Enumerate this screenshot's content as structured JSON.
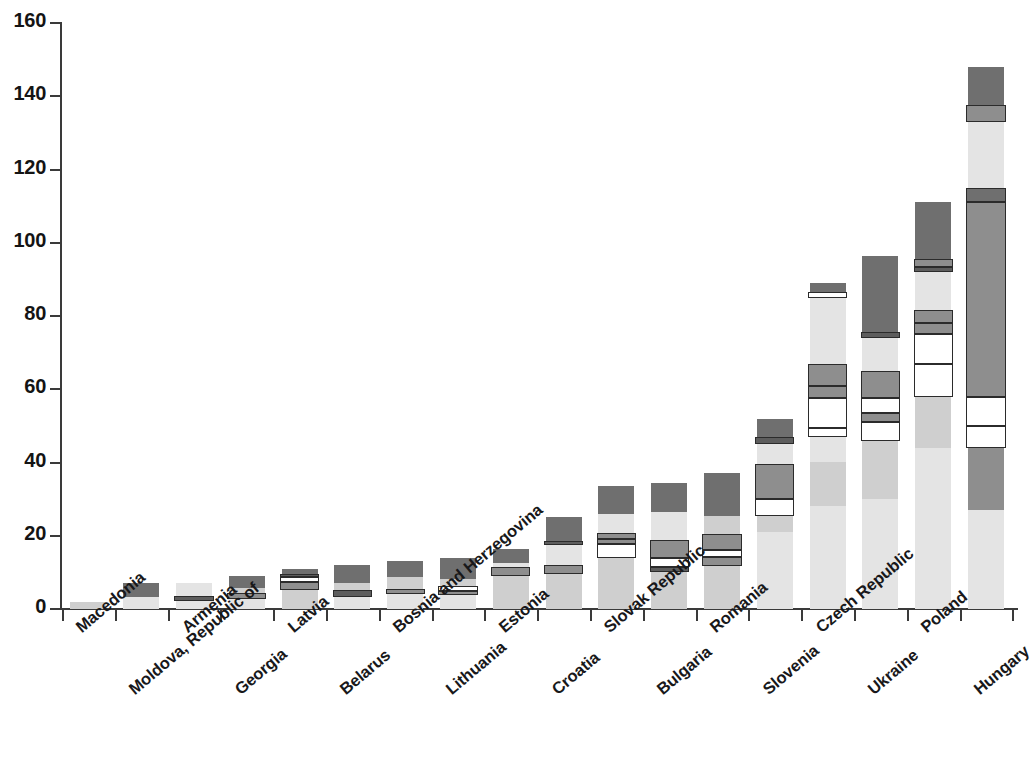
{
  "chart_data": {
    "type": "bar",
    "subtype": "stacked-bar",
    "title": "",
    "subtitle": "",
    "xlabel": "",
    "ylabel": "",
    "ylim": [
      0,
      160
    ],
    "y_ticks": [
      0,
      20,
      40,
      60,
      80,
      100,
      120,
      140,
      160
    ],
    "y_tick_labels": [
      "0",
      "20",
      "40",
      "60",
      "80",
      "100",
      "120",
      "140",
      "160"
    ],
    "grid": false,
    "legend": "none",
    "orientation": "vertical",
    "categories": [
      "Macedonia",
      "Moldova, Republic of",
      "Armenia",
      "Georgia",
      "Latvia",
      "Belarus",
      "Bosnia and Herzegovina",
      "Lithuania",
      "Estonia",
      "Croatia",
      "Slovak Republic",
      "Bulgaria",
      "Romania",
      "Slovenia",
      "Czech Republic",
      "Ukraine",
      "Poland",
      "Hungary"
    ],
    "totals": [
      2,
      7,
      7,
      9,
      11,
      12,
      13,
      14,
      16.5,
      25,
      33.5,
      34.5,
      37,
      52,
      89,
      96.5,
      111,
      148
    ],
    "segment_colors": {
      "dark": "#6f6f6f",
      "darker": "#5d5d5d",
      "mid": "#8e8e8e",
      "light": "#cfcfcf",
      "lighter": "#e4e4e4",
      "white": "#ffffff",
      "outline": "#2b2b2b"
    },
    "bars": [
      {
        "category": "Macedonia",
        "total": 2,
        "segments": [
          {
            "from": 0,
            "to": 2,
            "shade": "light",
            "outlined": false
          }
        ]
      },
      {
        "category": "Moldova, Republic of",
        "total": 7,
        "segments": [
          {
            "from": 0,
            "to": 3.3,
            "shade": "lighter",
            "outlined": false
          },
          {
            "from": 3.3,
            "to": 7,
            "shade": "dark",
            "outlined": false
          }
        ]
      },
      {
        "category": "Armenia",
        "total": 7,
        "segments": [
          {
            "from": 0,
            "to": 2.2,
            "shade": "lighter",
            "outlined": false
          },
          {
            "from": 2.2,
            "to": 3.6,
            "shade": "darker",
            "outlined": true
          },
          {
            "from": 3.6,
            "to": 7,
            "shade": "lighter",
            "outlined": false
          }
        ]
      },
      {
        "category": "Georgia",
        "total": 9,
        "segments": [
          {
            "from": 0,
            "to": 2.8,
            "shade": "lighter",
            "outlined": false
          },
          {
            "from": 2.8,
            "to": 4.4,
            "shade": "mid",
            "outlined": true
          },
          {
            "from": 4.4,
            "to": 5.6,
            "shade": "light",
            "outlined": false
          },
          {
            "from": 5.6,
            "to": 9,
            "shade": "dark",
            "outlined": false
          }
        ]
      },
      {
        "category": "Latvia",
        "total": 11,
        "segments": [
          {
            "from": 0,
            "to": 5.2,
            "shade": "light",
            "outlined": false
          },
          {
            "from": 5.2,
            "to": 7.5,
            "shade": "mid",
            "outlined": true
          },
          {
            "from": 7.5,
            "to": 8.6,
            "shade": "white",
            "outlined": true
          },
          {
            "from": 8.6,
            "to": 9.6,
            "shade": "darker",
            "outlined": true
          },
          {
            "from": 9.6,
            "to": 11,
            "shade": "dark",
            "outlined": false
          }
        ]
      },
      {
        "category": "Belarus",
        "total": 12,
        "segments": [
          {
            "from": 0,
            "to": 3.4,
            "shade": "lighter",
            "outlined": false
          },
          {
            "from": 3.4,
            "to": 5.2,
            "shade": "darker",
            "outlined": true
          },
          {
            "from": 5.2,
            "to": 7.2,
            "shade": "light",
            "outlined": false
          },
          {
            "from": 7.2,
            "to": 12,
            "shade": "dark",
            "outlined": false
          }
        ]
      },
      {
        "category": "Bosnia and Herzegovina",
        "total": 13,
        "segments": [
          {
            "from": 0,
            "to": 4.0,
            "shade": "lighter",
            "outlined": false
          },
          {
            "from": 4.0,
            "to": 5.4,
            "shade": "mid",
            "outlined": true
          },
          {
            "from": 5.4,
            "to": 8.6,
            "shade": "light",
            "outlined": false
          },
          {
            "from": 8.6,
            "to": 13,
            "shade": "dark",
            "outlined": false
          }
        ]
      },
      {
        "category": "Lithuania",
        "total": 14,
        "segments": [
          {
            "from": 0,
            "to": 3.8,
            "shade": "lighter",
            "outlined": false
          },
          {
            "from": 3.8,
            "to": 5.0,
            "shade": "mid",
            "outlined": true
          },
          {
            "from": 5.0,
            "to": 6.2,
            "shade": "white",
            "outlined": true
          },
          {
            "from": 6.2,
            "to": 8.2,
            "shade": "light",
            "outlined": false
          },
          {
            "from": 8.2,
            "to": 14,
            "shade": "dark",
            "outlined": false
          }
        ]
      },
      {
        "category": "Estonia",
        "total": 16.5,
        "segments": [
          {
            "from": 0,
            "to": 9.0,
            "shade": "light",
            "outlined": false
          },
          {
            "from": 9.0,
            "to": 11.4,
            "shade": "mid",
            "outlined": true
          },
          {
            "from": 11.4,
            "to": 12.6,
            "shade": "lighter",
            "outlined": false
          },
          {
            "from": 12.6,
            "to": 16.5,
            "shade": "dark",
            "outlined": false
          }
        ]
      },
      {
        "category": "Croatia",
        "total": 25,
        "segments": [
          {
            "from": 0,
            "to": 9.5,
            "shade": "light",
            "outlined": false
          },
          {
            "from": 9.5,
            "to": 12.0,
            "shade": "mid",
            "outlined": true
          },
          {
            "from": 12.0,
            "to": 17.5,
            "shade": "lighter",
            "outlined": false
          },
          {
            "from": 17.5,
            "to": 18.6,
            "shade": "darker",
            "outlined": true
          },
          {
            "from": 18.6,
            "to": 25,
            "shade": "dark",
            "outlined": false
          }
        ]
      },
      {
        "category": "Slovak Republic",
        "total": 33.5,
        "segments": [
          {
            "from": 0,
            "to": 14.0,
            "shade": "light",
            "outlined": false
          },
          {
            "from": 14.0,
            "to": 17.8,
            "shade": "white",
            "outlined": true
          },
          {
            "from": 17.8,
            "to": 19.0,
            "shade": "mid",
            "outlined": true
          },
          {
            "from": 19.0,
            "to": 20.8,
            "shade": "mid",
            "outlined": true
          },
          {
            "from": 20.8,
            "to": 26.0,
            "shade": "lighter",
            "outlined": false
          },
          {
            "from": 26.0,
            "to": 33.5,
            "shade": "dark",
            "outlined": false
          }
        ]
      },
      {
        "category": "Bulgaria",
        "total": 34.5,
        "segments": [
          {
            "from": 0,
            "to": 10.0,
            "shade": "light",
            "outlined": false
          },
          {
            "from": 10.0,
            "to": 11.6,
            "shade": "darker",
            "outlined": true
          },
          {
            "from": 11.6,
            "to": 14.0,
            "shade": "white",
            "outlined": true
          },
          {
            "from": 14.0,
            "to": 18.8,
            "shade": "mid",
            "outlined": true
          },
          {
            "from": 18.8,
            "to": 26.5,
            "shade": "lighter",
            "outlined": false
          },
          {
            "from": 26.5,
            "to": 34.5,
            "shade": "dark",
            "outlined": false
          }
        ]
      },
      {
        "category": "Romania",
        "total": 37,
        "segments": [
          {
            "from": 0,
            "to": 11.8,
            "shade": "light",
            "outlined": false
          },
          {
            "from": 11.8,
            "to": 14.2,
            "shade": "mid",
            "outlined": true
          },
          {
            "from": 14.2,
            "to": 16.0,
            "shade": "white",
            "outlined": true
          },
          {
            "from": 16.0,
            "to": 20.6,
            "shade": "mid",
            "outlined": true
          },
          {
            "from": 20.6,
            "to": 25.5,
            "shade": "light",
            "outlined": false
          },
          {
            "from": 25.5,
            "to": 37,
            "shade": "dark",
            "outlined": false
          }
        ]
      },
      {
        "category": "Slovenia",
        "total": 52,
        "segments": [
          {
            "from": 0,
            "to": 21.0,
            "shade": "lighter",
            "outlined": false
          },
          {
            "from": 21.0,
            "to": 25.5,
            "shade": "light",
            "outlined": false
          },
          {
            "from": 25.5,
            "to": 30.0,
            "shade": "white",
            "outlined": true
          },
          {
            "from": 30.0,
            "to": 39.5,
            "shade": "mid",
            "outlined": true
          },
          {
            "from": 39.5,
            "to": 45.0,
            "shade": "lighter",
            "outlined": false
          },
          {
            "from": 45.0,
            "to": 47.0,
            "shade": "darker",
            "outlined": true
          },
          {
            "from": 47.0,
            "to": 52,
            "shade": "dark",
            "outlined": false
          }
        ]
      },
      {
        "category": "Czech Republic",
        "total": 89,
        "segments": [
          {
            "from": 0,
            "to": 28.0,
            "shade": "lighter",
            "outlined": false
          },
          {
            "from": 28.0,
            "to": 40.0,
            "shade": "light",
            "outlined": false
          },
          {
            "from": 40.0,
            "to": 47.0,
            "shade": "lighter",
            "outlined": false
          },
          {
            "from": 47.0,
            "to": 49.5,
            "shade": "white",
            "outlined": true
          },
          {
            "from": 49.5,
            "to": 57.5,
            "shade": "white",
            "outlined": true
          },
          {
            "from": 57.5,
            "to": 61.0,
            "shade": "mid",
            "outlined": true
          },
          {
            "from": 61.0,
            "to": 67.0,
            "shade": "mid",
            "outlined": true
          },
          {
            "from": 67.0,
            "to": 85.0,
            "shade": "lighter",
            "outlined": false
          },
          {
            "from": 85.0,
            "to": 86.5,
            "shade": "white",
            "outlined": true
          },
          {
            "from": 86.5,
            "to": 89,
            "shade": "dark",
            "outlined": false
          }
        ]
      },
      {
        "category": "Ukraine",
        "total": 96.5,
        "segments": [
          {
            "from": 0,
            "to": 30.0,
            "shade": "lighter",
            "outlined": false
          },
          {
            "from": 30.0,
            "to": 46.0,
            "shade": "light",
            "outlined": false
          },
          {
            "from": 46.0,
            "to": 51.0,
            "shade": "white",
            "outlined": true
          },
          {
            "from": 51.0,
            "to": 53.5,
            "shade": "mid",
            "outlined": true
          },
          {
            "from": 53.5,
            "to": 57.5,
            "shade": "white",
            "outlined": true
          },
          {
            "from": 57.5,
            "to": 65.0,
            "shade": "mid",
            "outlined": true
          },
          {
            "from": 65.0,
            "to": 74.0,
            "shade": "lighter",
            "outlined": false
          },
          {
            "from": 74.0,
            "to": 75.5,
            "shade": "darker",
            "outlined": true
          },
          {
            "from": 75.5,
            "to": 96.5,
            "shade": "dark",
            "outlined": false
          }
        ]
      },
      {
        "category": "Poland",
        "total": 111,
        "segments": [
          {
            "from": 0,
            "to": 44.0,
            "shade": "lighter",
            "outlined": false
          },
          {
            "from": 44.0,
            "to": 58.0,
            "shade": "light",
            "outlined": false
          },
          {
            "from": 58.0,
            "to": 67.0,
            "shade": "white",
            "outlined": true
          },
          {
            "from": 67.0,
            "to": 75.0,
            "shade": "white",
            "outlined": true
          },
          {
            "from": 75.0,
            "to": 78.0,
            "shade": "mid",
            "outlined": true
          },
          {
            "from": 78.0,
            "to": 81.5,
            "shade": "mid",
            "outlined": true
          },
          {
            "from": 81.5,
            "to": 92.0,
            "shade": "lighter",
            "outlined": false
          },
          {
            "from": 92.0,
            "to": 93.5,
            "shade": "darker",
            "outlined": true
          },
          {
            "from": 93.5,
            "to": 95.5,
            "shade": "mid",
            "outlined": true
          },
          {
            "from": 95.5,
            "to": 111,
            "shade": "dark",
            "outlined": false
          }
        ]
      },
      {
        "category": "Hungary",
        "total": 148,
        "segments": [
          {
            "from": 0,
            "to": 27.0,
            "shade": "lighter",
            "outlined": false
          },
          {
            "from": 27.0,
            "to": 44.0,
            "shade": "mid",
            "outlined": false
          },
          {
            "from": 44.0,
            "to": 50.0,
            "shade": "white",
            "outlined": true
          },
          {
            "from": 50.0,
            "to": 58.0,
            "shade": "white",
            "outlined": true
          },
          {
            "from": 58.0,
            "to": 111.0,
            "shade": "mid",
            "outlined": true
          },
          {
            "from": 111.0,
            "to": 115.0,
            "shade": "dark",
            "outlined": true
          },
          {
            "from": 115.0,
            "to": 133.0,
            "shade": "lighter",
            "outlined": false
          },
          {
            "from": 133.0,
            "to": 137.5,
            "shade": "mid",
            "outlined": true
          },
          {
            "from": 137.5,
            "to": 148,
            "shade": "dark",
            "outlined": false
          }
        ]
      }
    ]
  },
  "axis": {
    "y_labels": [
      "160",
      "140",
      "120",
      "100",
      "80",
      "60",
      "40",
      "20",
      "0"
    ]
  }
}
